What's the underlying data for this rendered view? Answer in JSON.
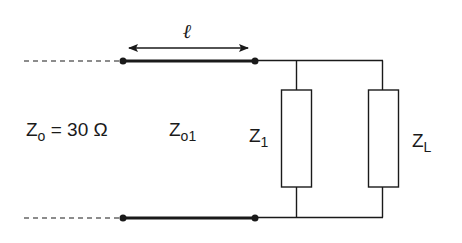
{
  "diagram": {
    "type": "transmission-line-circuit",
    "colors": {
      "line": "#1a1a1a",
      "background": "#ffffff"
    },
    "labels": {
      "length_symbol": "ℓ",
      "z0_main": "Z",
      "z0_sub": "o",
      "z0_value": " = 30 Ω",
      "z01_main": "Z",
      "z01_sub": "o1",
      "z1_main": "Z",
      "z1_sub": "1",
      "zl_main": "Z",
      "zl_sub": "L"
    },
    "components": [
      {
        "name": "feed-line",
        "style": "dashed",
        "characteristic_impedance": "Zo = 30 Ω"
      },
      {
        "name": "transmission-line-section",
        "style": "thick",
        "characteristic_impedance": "Zo1",
        "length": "ℓ"
      },
      {
        "name": "shunt-impedance",
        "label": "Z1"
      },
      {
        "name": "load-impedance",
        "label": "ZL"
      }
    ]
  }
}
